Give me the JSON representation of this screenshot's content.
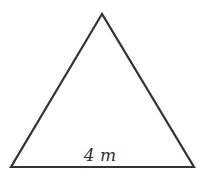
{
  "diagram": {
    "shape": "triangle",
    "type": "isosceles",
    "stroke_color": "#333333",
    "fill_color": "#ffffff",
    "base_label": "4 m",
    "vertices": {
      "apex": [
        102,
        14
      ],
      "bottom_left": [
        11,
        167
      ],
      "bottom_right": [
        194,
        167
      ]
    }
  }
}
